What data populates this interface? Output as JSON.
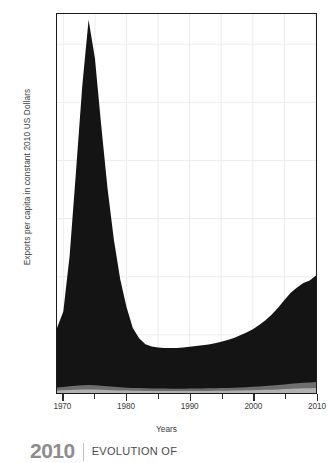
{
  "chart_data": {
    "type": "area",
    "title": "",
    "xlabel": "Years",
    "ylabel": "Exports per capita in constant 2010 US Dollars",
    "xlim": [
      1969,
      2010
    ],
    "ylim": [
      0,
      3260
    ],
    "grid": true,
    "legend_position": "none",
    "x_ticks": [
      {
        "value": 1970,
        "label": "1970",
        "major": true
      },
      {
        "value": 1975,
        "label": "",
        "major": false
      },
      {
        "value": 1980,
        "label": "1980",
        "major": true
      },
      {
        "value": 1985,
        "label": "",
        "major": false
      },
      {
        "value": 1990,
        "label": "1990",
        "major": true
      },
      {
        "value": 1995,
        "label": "",
        "major": false
      },
      {
        "value": 2000,
        "label": "2000",
        "major": true
      },
      {
        "value": 2005,
        "label": "",
        "major": false
      },
      {
        "value": 2010,
        "label": "2010",
        "major": true
      }
    ],
    "y_ticks": [
      {
        "value": 500,
        "label": "500"
      },
      {
        "value": 1000,
        "label": "1.0k"
      },
      {
        "value": 1500,
        "label": "1.5k"
      },
      {
        "value": 2000,
        "label": "2.0k"
      },
      {
        "value": 2500,
        "label": "2.5k"
      },
      {
        "value": 3000,
        "label": "3.0k"
      }
    ],
    "x": [
      1969,
      1970,
      1971,
      1972,
      1973,
      1974,
      1975,
      1976,
      1977,
      1978,
      1979,
      1980,
      1981,
      1982,
      1983,
      1984,
      1985,
      1986,
      1987,
      1988,
      1989,
      1990,
      1991,
      1992,
      1993,
      1994,
      1995,
      1996,
      1997,
      1998,
      1999,
      2000,
      2001,
      2002,
      2003,
      2004,
      2005,
      2006,
      2007,
      2008,
      2009,
      2010
    ],
    "series": [
      {
        "name": "Total exports per capita",
        "color": "#141414",
        "values": [
          560,
          700,
          1180,
          1900,
          2640,
          3210,
          2880,
          2300,
          1760,
          1320,
          980,
          740,
          560,
          470,
          420,
          400,
          392,
          388,
          386,
          388,
          392,
          398,
          404,
          410,
          418,
          428,
          440,
          456,
          474,
          496,
          520,
          548,
          584,
          626,
          676,
          734,
          800,
          862,
          908,
          946,
          968,
          1010
        ]
      },
      {
        "name": "Lower band A",
        "color": "#6e6e6e",
        "values": [
          48,
          52,
          58,
          62,
          66,
          68,
          66,
          62,
          58,
          54,
          50,
          46,
          44,
          42,
          40,
          39,
          38,
          38,
          37,
          37,
          37,
          38,
          38,
          39,
          40,
          41,
          42,
          44,
          46,
          48,
          50,
          53,
          56,
          60,
          64,
          69,
          74,
          80,
          84,
          88,
          90,
          94
        ]
      },
      {
        "name": "Lower band B",
        "color": "#b0b0b0",
        "values": [
          22,
          24,
          26,
          28,
          30,
          31,
          30,
          28,
          26,
          24,
          22,
          21,
          20,
          19,
          18,
          18,
          17,
          17,
          17,
          17,
          17,
          17,
          18,
          18,
          18,
          19,
          19,
          20,
          21,
          22,
          23,
          24,
          26,
          27,
          29,
          31,
          34,
          36,
          38,
          40,
          41,
          43
        ]
      }
    ]
  },
  "axes": {
    "y_label": "Exports per capita in constant 2010 US Dollars",
    "x_label": "Years"
  },
  "caption": {
    "year": "2010",
    "title": "EVOLUTION OF"
  }
}
